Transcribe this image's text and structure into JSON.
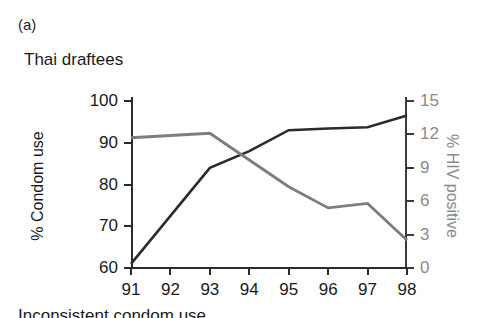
{
  "panel": {
    "label": "(a)",
    "title": "Thai draftees"
  },
  "axes": {
    "left": {
      "title": "% Condom use",
      "ticks": [
        "60",
        "70",
        "80",
        "90",
        "100"
      ],
      "color": "#1a1a1a"
    },
    "right": {
      "title": "% HIV positive",
      "ticks": [
        "0",
        "3",
        "6",
        "9",
        "12",
        "15"
      ],
      "color": "#8a8a8a"
    },
    "bottom": {
      "title": "",
      "ticks": [
        "91",
        "92",
        "93",
        "94",
        "95",
        "96",
        "97",
        "98"
      ]
    }
  },
  "legend_cropped": {
    "text": "Inconsistent condom use"
  },
  "colors": {
    "condom_use_line": "#2b2b2b",
    "hiv_line": "#7d7d7d",
    "axis": "#2b2b2b",
    "right_axis_text": "#8a8a8a",
    "background": "#ffffff"
  },
  "chart_data": {
    "type": "line",
    "title": "Thai draftees",
    "subtitle": "",
    "xlabel": "",
    "ylabel": "% Condom use",
    "y2label": "% HIV positive",
    "x": [
      "91",
      "92",
      "93",
      "94",
      "95",
      "96",
      "97",
      "98"
    ],
    "xlim": [
      0,
      7
    ],
    "ylim": [
      60,
      100
    ],
    "y2lim": [
      0,
      15
    ],
    "grid": false,
    "legend_position": "none",
    "series": [
      {
        "name": "% Condom use",
        "axis": "left",
        "color": "#2b2b2b",
        "values": [
          61,
          72.5,
          84,
          88,
          93,
          93.4,
          93.7,
          96.5
        ]
      },
      {
        "name": "% HIV positive",
        "axis": "right",
        "color": "#7d7d7d",
        "values": [
          11.7,
          11.9,
          12.1,
          9.7,
          7.3,
          5.4,
          5.8,
          2.5
        ]
      }
    ],
    "annotations": []
  }
}
